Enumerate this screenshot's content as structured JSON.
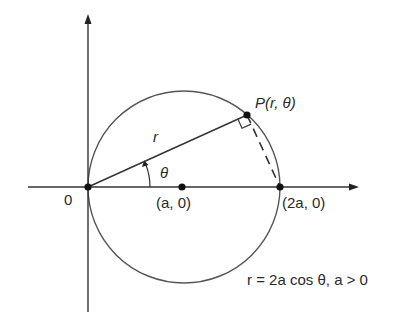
{
  "figure": {
    "type": "polar-circle-diagram",
    "labels": {
      "origin": "0",
      "point_a": "(a, 0)",
      "point_2a": "(2a, 0)",
      "point_p": "P(r, θ)",
      "radius": "r",
      "angle": "θ",
      "equation": "r = 2a cos θ, a > 0"
    },
    "points": [
      {
        "name": "O",
        "label": "0"
      },
      {
        "name": "A",
        "label": "(a, 0)"
      },
      {
        "name": "B",
        "label": "(2a, 0)"
      },
      {
        "name": "P",
        "label": "P(r, θ)"
      }
    ],
    "colors": {
      "stroke": "#333333",
      "circle": "#555555",
      "text": "#2a2a2a"
    }
  }
}
